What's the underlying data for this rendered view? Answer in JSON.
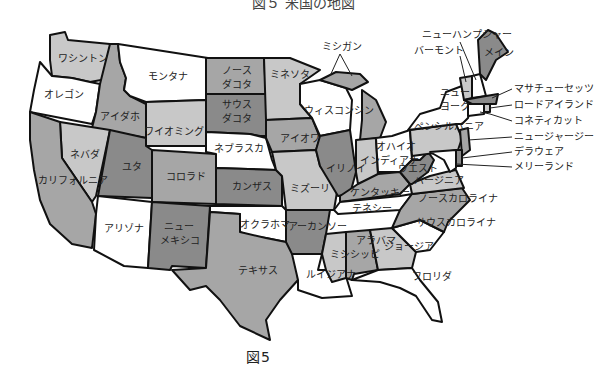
{
  "title_partial": "図５ 米国の地図",
  "caption": "図5",
  "colors": {
    "white": "#ffffff",
    "light": "#c8c8c8",
    "medium": "#a6a6a6",
    "dark": "#8a8a8a",
    "border": "#111111"
  },
  "states": {
    "washington": "ワシントン",
    "oregon": "オレゴン",
    "california": "カリフォルニア",
    "nevada": "ネバダ",
    "idaho": "アイダホ",
    "montana": "モンタナ",
    "wyoming": "ワイオミング",
    "utah": "ユタ",
    "colorado": "コロラド",
    "arizona": "アリゾナ",
    "new_mexico_1": "ニュー",
    "new_mexico_2": "メキシコ",
    "north_dakota_1": "ノース",
    "north_dakota_2": "ダコタ",
    "south_dakota_1": "サウス",
    "south_dakota_2": "ダコタ",
    "nebraska": "ネブラスカ",
    "kansas": "カンザス",
    "oklahoma": "オクラホマ",
    "texas": "テキサス",
    "minnesota": "ミネソタ",
    "iowa": "アイオワ",
    "missouri": "ミズーリ",
    "arkansas": "アーカンソー",
    "louisiana": "ルイジアナ",
    "wisconsin": "ウィスコンシン",
    "illinois": "イリノイ",
    "michigan": "ミシガン",
    "indiana": "インディアナ",
    "ohio": "オハイオ",
    "kentucky": "ケンタッキー",
    "tennessee": "テネシー",
    "mississippi": "ミシシッピ",
    "alabama": "アラバマ",
    "georgia": "ジョージア",
    "florida": "フロリダ",
    "south_carolina": "サウスカロライナ",
    "north_carolina": "ノースカロライナ",
    "virginia": "バージニア",
    "west_virginia_1": "ウエスト",
    "west_virginia_2": "バージニア",
    "pennsylvania": "ペンシルバニア",
    "new_york_1": "ニュー",
    "new_york_2": "ヨーク",
    "maine": "メイン",
    "new_hampshire": "ニューハンプシャー",
    "vermont": "バーモント",
    "massachusetts": "マサチューセッツ",
    "rhode_island": "ロードアイランド",
    "connecticut": "コネティカット",
    "new_jersey": "ニュージャージー",
    "delaware": "デラウェア",
    "maryland": "メリーランド"
  }
}
